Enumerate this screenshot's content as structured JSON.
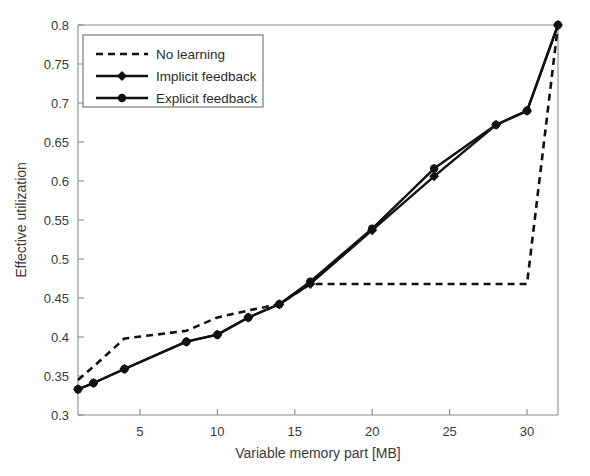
{
  "chart_data": {
    "type": "line",
    "title": "",
    "xlabel": "Variable memory part [MB]",
    "ylabel": "Effective utilization",
    "xlim": [
      1,
      32
    ],
    "ylim": [
      0.3,
      0.8
    ],
    "xticks": [
      5,
      10,
      15,
      20,
      25,
      30
    ],
    "xticklabels": [
      "5",
      "10",
      "15",
      "20",
      "25",
      "30"
    ],
    "yticks": [
      0.3,
      0.35,
      0.4,
      0.45,
      0.5,
      0.55,
      0.6,
      0.65,
      0.7,
      0.75,
      0.8
    ],
    "yticklabels": [
      "0.3",
      "0.35",
      "0.4",
      "0.45",
      "0.5",
      "0.55",
      "0.6",
      "0.65",
      "0.7",
      "0.75",
      "0.8"
    ],
    "grid": false,
    "legend_position": "upper left",
    "series": [
      {
        "name": "No learning",
        "style": "dashed",
        "marker": "none",
        "color": "#111111",
        "x": [
          1,
          2,
          4,
          8,
          10,
          12,
          14,
          16,
          20,
          24,
          28,
          30,
          32
        ],
        "values": [
          0.345,
          0.362,
          0.398,
          0.408,
          0.425,
          0.434,
          0.442,
          0.468,
          0.468,
          0.468,
          0.468,
          0.468,
          0.8
        ]
      },
      {
        "name": "Implicit feedback",
        "style": "solid",
        "marker": "diamond",
        "color": "#111111",
        "x": [
          1,
          2,
          4,
          8,
          10,
          12,
          14,
          16,
          20,
          24,
          28,
          30,
          32
        ],
        "values": [
          0.333,
          0.341,
          0.359,
          0.394,
          0.403,
          0.425,
          0.442,
          0.468,
          0.537,
          0.606,
          0.672,
          0.69,
          0.8
        ]
      },
      {
        "name": "Explicit feedback",
        "style": "solid",
        "marker": "circle",
        "color": "#111111",
        "x": [
          1,
          2,
          4,
          8,
          10,
          12,
          14,
          16,
          20,
          24,
          28,
          30,
          32
        ],
        "values": [
          0.333,
          0.341,
          0.359,
          0.394,
          0.403,
          0.425,
          0.442,
          0.471,
          0.539,
          0.616,
          0.672,
          0.69,
          0.8
        ]
      }
    ]
  },
  "legend": {
    "entries": [
      {
        "label": "No learning"
      },
      {
        "label": "Implicit feedback"
      },
      {
        "label": "Explicit feedback"
      }
    ]
  },
  "axes": {
    "x_title": "Variable memory part [MB]",
    "y_title": "Effective utilization"
  }
}
